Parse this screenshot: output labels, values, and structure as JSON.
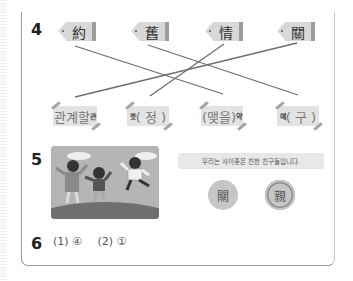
{
  "q4": {
    "number": "4",
    "tags": [
      {
        "hanja": "約"
      },
      {
        "hanja": "舊"
      },
      {
        "hanja": "情"
      },
      {
        "hanja": "關"
      }
    ],
    "labels": [
      {
        "meaning": "관계할",
        "sound": "관",
        "style": "meaning-big"
      },
      {
        "meaning": "뜻",
        "sound": "( 정 )",
        "style": "sound-big"
      },
      {
        "meaning": "(맺을)",
        "sound": "약",
        "style": "meaning-big"
      },
      {
        "meaning": "예",
        "sound": "( 구 )",
        "style": "sound-big"
      }
    ],
    "connections": [
      {
        "from": "約",
        "to": "맺을 약"
      },
      {
        "from": "舊",
        "to": "예 구"
      },
      {
        "from": "情",
        "to": "뜻 정"
      },
      {
        "from": "關",
        "to": "관계할 관"
      }
    ]
  },
  "q5": {
    "number": "5",
    "picture": "children-jumping-illustration",
    "sentence": "우리는 사이좋은 친한 친구들입니다.",
    "options": [
      {
        "hanja": "關",
        "selected": false
      },
      {
        "hanja": "親",
        "selected": true
      }
    ]
  },
  "q6": {
    "number": "6",
    "answers": [
      "(1) ④",
      "(2) ①"
    ]
  },
  "colors": {
    "tag_bg": "#d8d8d8",
    "line": "#6e6e6e",
    "label_bg": "#e3e3e3"
  }
}
